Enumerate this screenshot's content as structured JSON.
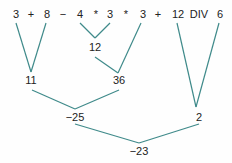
{
  "expression": {
    "tokens": [
      "3",
      "+",
      "8",
      "−",
      "4",
      "*",
      "3",
      "*",
      "3",
      "+",
      "12",
      "DIV",
      "6"
    ]
  },
  "nodes": {
    "mult1": "12",
    "add1": "11",
    "mult2": "36",
    "sub1": "−25",
    "div1": "2",
    "final": "−23"
  },
  "colors": {
    "edge": "#3f8a8a",
    "text": "#222222"
  }
}
